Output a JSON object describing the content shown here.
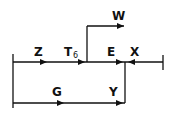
{
  "diagram": {
    "type": "signal-flow",
    "labels": {
      "Z": "Z",
      "T": "T",
      "T_sub": "6",
      "E": "E",
      "X": "X",
      "W": "W",
      "G": "G",
      "Y": "Y"
    },
    "edges": [
      {
        "name": "Z",
        "from": "left-source",
        "to": "T6-junction",
        "direction": "right"
      },
      {
        "name": "E",
        "from": "T6-junction",
        "to": "merge-point",
        "direction": "right"
      },
      {
        "name": "X",
        "from": "right-source",
        "to": "merge-point",
        "direction": "left"
      },
      {
        "name": "W",
        "from": "T6-junction",
        "to": "output-W",
        "direction": "right"
      },
      {
        "name": "G",
        "from": "left-source",
        "to": "merge-point",
        "direction": "right"
      },
      {
        "name": "Y",
        "from": "merge-point",
        "to": "bottom-line",
        "direction": "down"
      }
    ],
    "line_color": "#111111"
  }
}
